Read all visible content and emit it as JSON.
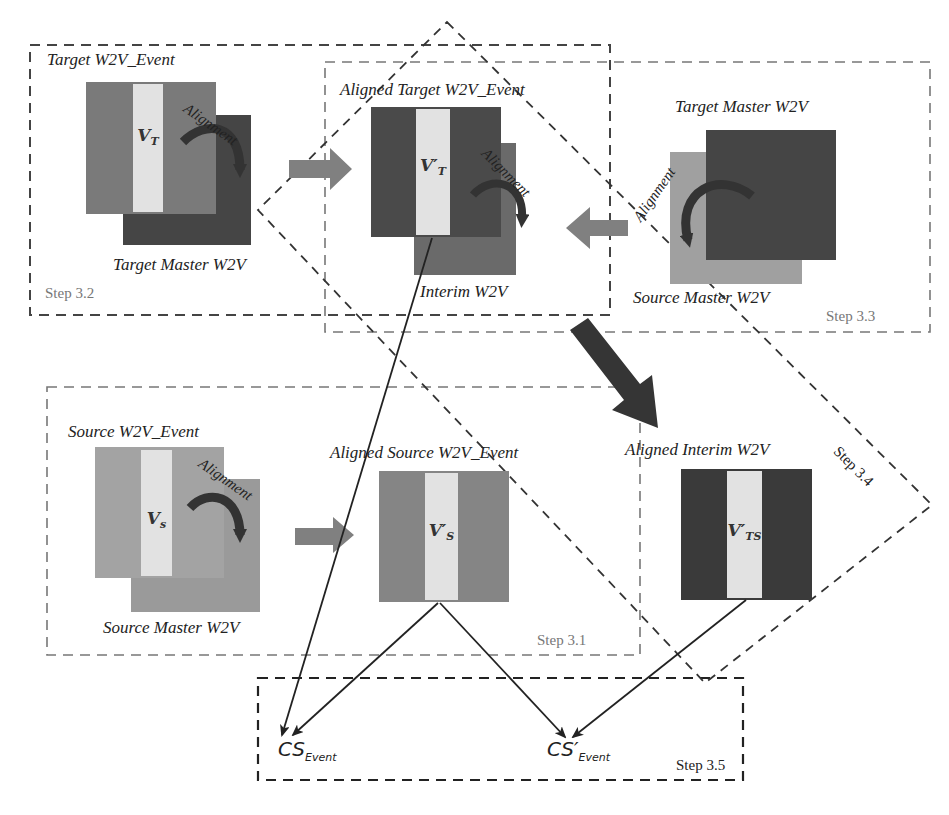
{
  "colors": {
    "target_event": "#7a7a7a",
    "target_master": "#454545",
    "aligned_target": "#4a4a4a",
    "interim": "#6a6a6a",
    "source_event": "#a3a3a3",
    "source_master": "#9a9a9a",
    "aligned_source": "#858585",
    "aligned_interim": "#3a3a3a",
    "stripe": "#e2e2e2",
    "block_arrow": "#808080",
    "dark_arrow": "#353535",
    "dash": "#555555"
  },
  "step32": {
    "label_event": "Target W2V_Event",
    "label_master": "Target Master W2V",
    "vector": "V",
    "vector_sub": "T",
    "alignment": "Alignment",
    "step": "Step 3.2"
  },
  "step_aligned_target": {
    "label": "Aligned Target W2V_Event",
    "label_interim": "Interim  W2V",
    "vector": "V′",
    "vector_sub": "T",
    "alignment": "Alignment"
  },
  "step33": {
    "label_target_master": "Target Master W2V",
    "label_source_master": "Source Master W2V",
    "alignment": "Alignment",
    "step": "Step 3.3"
  },
  "step31": {
    "label_event": "Source W2V_Event",
    "label_master": "Source Master W2V",
    "label_aligned": "Aligned Source W2V_Event",
    "vector": "V",
    "vector_sub": "s",
    "aligned_vector": "V′",
    "aligned_vector_sub": "S",
    "alignment": "Alignment",
    "step": "Step 3.1"
  },
  "step34": {
    "label": "Aligned Interim  W2V",
    "vector": "V′",
    "vector_sub": "TS",
    "step": "Step 3.4"
  },
  "step35": {
    "cs_event": "CS",
    "cs_event_sub": "Event",
    "cs_event_prime": "CS′",
    "cs_event_prime_sub": "Event",
    "step": "Step 3.5"
  }
}
